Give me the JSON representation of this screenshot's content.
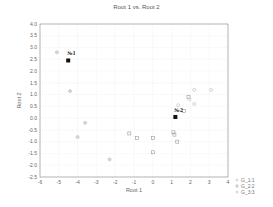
{
  "chart_data": {
    "type": "scatter",
    "title": "Root 1 vs. Root 2",
    "xlabel": "Root 1",
    "ylabel": "Root 2",
    "xlim": [
      -6,
      4
    ],
    "ylim": [
      -2.5,
      4.0
    ],
    "xticks": [
      "-6",
      "-5",
      "-4",
      "-3",
      "-2",
      "-1",
      "0",
      "1",
      "2",
      "3",
      "4"
    ],
    "yticks": [
      "4.0",
      "3.5",
      "3.0",
      "2.5",
      "2.0",
      "1.5",
      "1.0",
      "0.5",
      "0.0",
      "-0.5",
      "-1.0",
      "-1.5",
      "-2.0",
      "-2.5"
    ],
    "grid": true,
    "legend_position": "right-bottom",
    "legend": [
      "G_1:1",
      "G_2:2",
      "G_3:3"
    ],
    "centroids": [
      {
        "label": "№1",
        "x": -4.5,
        "y": 2.45
      },
      {
        "label": "№2",
        "x": 1.2,
        "y": 0.05
      }
    ],
    "series": [
      {
        "name": "G_1:1",
        "marker": "circle",
        "points": [
          {
            "x": -5.1,
            "y": 2.8
          },
          {
            "x": -4.4,
            "y": 1.15
          },
          {
            "x": -3.6,
            "y": -0.2
          },
          {
            "x": -4.0,
            "y": -0.8
          },
          {
            "x": -2.3,
            "y": -1.75
          }
        ]
      },
      {
        "name": "G_2:2",
        "marker": "square",
        "points": [
          {
            "x": -1.25,
            "y": -0.65
          },
          {
            "x": -0.85,
            "y": -0.85
          },
          {
            "x": 0.0,
            "y": -0.85
          },
          {
            "x": 0.0,
            "y": -1.45
          },
          {
            "x": 1.1,
            "y": -0.6
          },
          {
            "x": 1.15,
            "y": -0.7
          },
          {
            "x": 1.3,
            "y": -1.0
          },
          {
            "x": 1.65,
            "y": 0.3
          },
          {
            "x": 1.9,
            "y": 0.9
          }
        ]
      },
      {
        "name": "G_3:3",
        "marker": "circle-light",
        "points": [
          {
            "x": 1.35,
            "y": 0.55
          },
          {
            "x": 1.95,
            "y": 0.8
          },
          {
            "x": 2.2,
            "y": 1.2
          },
          {
            "x": 2.2,
            "y": 0.6
          },
          {
            "x": 3.1,
            "y": 1.2
          }
        ]
      }
    ]
  }
}
